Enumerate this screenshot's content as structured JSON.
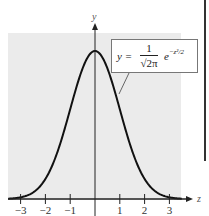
{
  "chart_data": {
    "type": "line",
    "title": "",
    "xlabel": "z",
    "ylabel": "y",
    "equation": {
      "lhs": "y =",
      "numerator": "1",
      "denominator": "√2π",
      "exponential": "e",
      "exponent": "−z²/2"
    },
    "x_ticks": [
      -3,
      -2,
      -1,
      1,
      2,
      3
    ],
    "x_tick_labels": [
      "−3",
      "−2",
      "−1",
      "1",
      "2",
      "3"
    ],
    "xlim": [
      -3.5,
      3.5
    ],
    "ylim": [
      0,
      0.42
    ],
    "grid": false,
    "legend": "none",
    "series": [
      {
        "name": "standard normal density",
        "x": [
          -3.5,
          -3.0,
          -2.5,
          -2.0,
          -1.5,
          -1.0,
          -0.5,
          0,
          0.5,
          1.0,
          1.5,
          2.0,
          2.5,
          3.0,
          3.5
        ],
        "values": [
          0.0009,
          0.0044,
          0.0175,
          0.054,
          0.1295,
          0.242,
          0.3521,
          0.3989,
          0.3521,
          0.242,
          0.1295,
          0.054,
          0.0175,
          0.0044,
          0.0009
        ]
      }
    ]
  },
  "colors": {
    "plot_background": "#ebebeb",
    "curve": "#111111",
    "axes": "#222222"
  }
}
